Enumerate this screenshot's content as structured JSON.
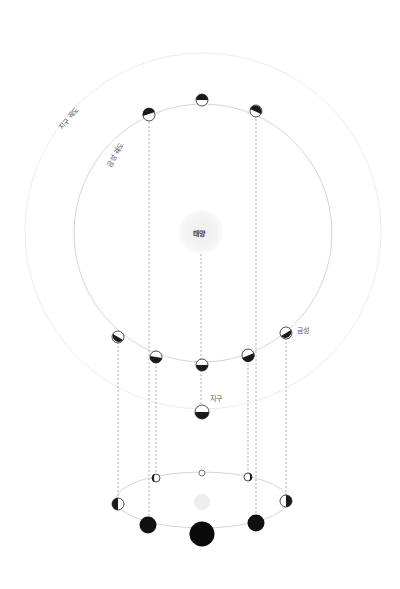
{
  "labels": {
    "earth_orbit": "지구 궤도",
    "venus_orbit": "금성 궤도",
    "sun": "태양",
    "earth": "지구",
    "venus": "금성"
  },
  "colors": {
    "orbit_outer": "#ececec",
    "orbit_inner": "#d8d8d8",
    "sun": "#f2f2f2",
    "dark": "#1a1a1a",
    "dash": "#9a9a9a"
  }
}
